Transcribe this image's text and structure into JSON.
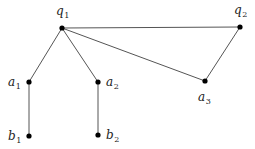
{
  "diagram": {
    "type": "graph",
    "nodes": [
      {
        "id": "q1",
        "base": "q",
        "sub": "1",
        "x": 62,
        "y": 28,
        "lx": 56,
        "ly": 15
      },
      {
        "id": "q2",
        "base": "q",
        "sub": "2",
        "x": 240,
        "y": 27,
        "lx": 234,
        "ly": 14
      },
      {
        "id": "a1",
        "base": "a",
        "sub": "1",
        "x": 29,
        "y": 82,
        "lx": 8,
        "ly": 86
      },
      {
        "id": "a2",
        "base": "a",
        "sub": "2",
        "x": 98,
        "y": 82,
        "lx": 106,
        "ly": 86
      },
      {
        "id": "a3",
        "base": "a",
        "sub": "3",
        "x": 205,
        "y": 81,
        "lx": 198,
        "ly": 101
      },
      {
        "id": "b1",
        "base": "b",
        "sub": "1",
        "x": 29,
        "y": 136,
        "lx": 8,
        "ly": 140
      },
      {
        "id": "b2",
        "base": "b",
        "sub": "2",
        "x": 98,
        "y": 135,
        "lx": 106,
        "ly": 139
      }
    ],
    "edges": [
      [
        "q1",
        "q2"
      ],
      [
        "q1",
        "a3"
      ],
      [
        "q2",
        "a3"
      ],
      [
        "q1",
        "a1"
      ],
      [
        "q1",
        "a2"
      ],
      [
        "a1",
        "b1"
      ],
      [
        "a2",
        "b2"
      ]
    ]
  }
}
